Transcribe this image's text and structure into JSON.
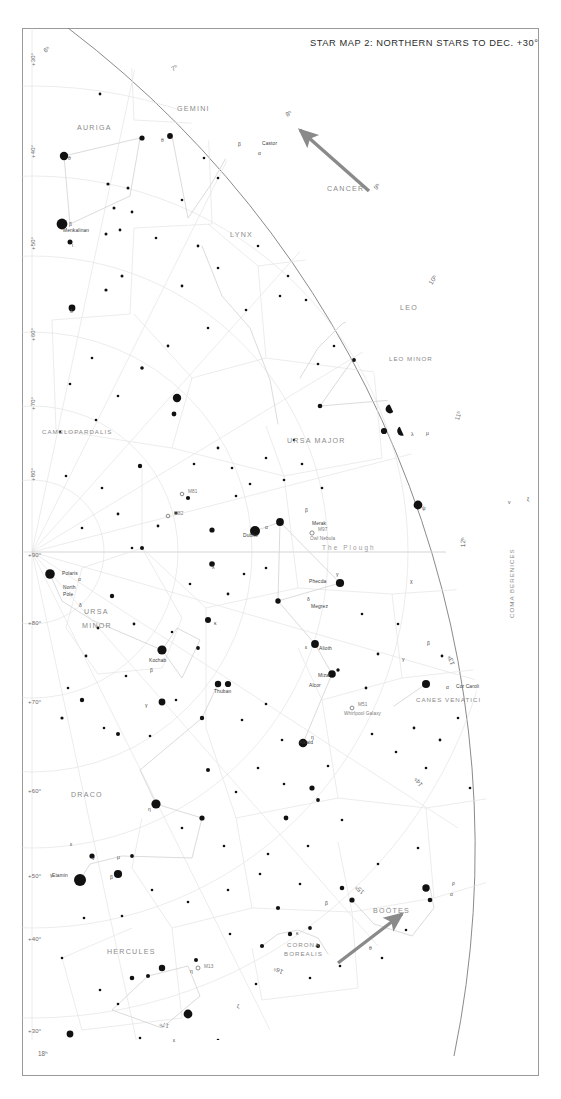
{
  "page": {
    "title": "STAR MAP 2: NORTHERN STARS TO DEC. +30°",
    "width": 561,
    "height": 1099,
    "background": "#ffffff",
    "frame_color": "#8e8e8e",
    "arrow_color": "#8a8a8a"
  },
  "chart_data": {
    "type": "scatter",
    "title": "STAR MAP 2: NORTHERN STARS TO DEC. +30°",
    "projection": "polar azimuthal, north pole centre-left",
    "xlabel": "Right Ascension (hours)",
    "ylabel": "Declination (degrees)",
    "grid": true,
    "legend_position": "none",
    "ra_range_hours": [
      6,
      18
    ],
    "dec_range_deg": [
      30,
      90
    ],
    "declination_labels": [
      "+30°",
      "+40°",
      "+50°",
      "+60°",
      "+70°",
      "+80°",
      "+90°"
    ],
    "right_ascension_labels": [
      "6ʰ",
      "7ʰ",
      "8ʰ",
      "9ʰ",
      "10ʰ",
      "11ʰ",
      "12ʰ",
      "13ʰ",
      "14ʰ",
      "15ʰ",
      "16ʰ",
      "17ʰ",
      "18ʰ"
    ],
    "constellations": [
      "AURIGA",
      "GEMINI",
      "CANCER",
      "LYNX",
      "LEO",
      "LEO MINOR",
      "CAMELOPARDALIS",
      "URSA MAJOR",
      "URSA MINOR",
      "DRACO",
      "CANES VENATICI",
      "COMA BERENICES",
      "BOÖTES",
      "CORONA BOREALIS",
      "HERCULES"
    ],
    "named_stars": [
      {
        "name": "Castor",
        "bayer": "α",
        "constellation": "GEMINI"
      },
      {
        "name": "Menkalinan",
        "bayer": "β",
        "constellation": "AURIGA"
      },
      {
        "name": "Polaris",
        "bayer": "α",
        "constellation": "URSA MINOR"
      },
      {
        "name": "Kochab",
        "bayer": "β",
        "constellation": "URSA MINOR"
      },
      {
        "name": "Dubhe",
        "bayer": "α",
        "constellation": "URSA MAJOR"
      },
      {
        "name": "Merak",
        "bayer": "β",
        "constellation": "URSA MAJOR"
      },
      {
        "name": "Phecda",
        "bayer": "γ",
        "constellation": "URSA MAJOR"
      },
      {
        "name": "Megrez",
        "bayer": "δ",
        "constellation": "URSA MAJOR"
      },
      {
        "name": "Alioth",
        "bayer": "ε",
        "constellation": "URSA MAJOR"
      },
      {
        "name": "Mizar",
        "bayer": "ζ",
        "constellation": "URSA MAJOR"
      },
      {
        "name": "Alcor",
        "bayer": "80",
        "constellation": "URSA MAJOR"
      },
      {
        "name": "Alkaid",
        "bayer": "η",
        "constellation": "URSA MAJOR"
      },
      {
        "name": "Thuban",
        "bayer": "α",
        "constellation": "DRACO"
      },
      {
        "name": "Etamin",
        "bayer": "γ",
        "constellation": "DRACO"
      },
      {
        "name": "Cor Caroli",
        "bayer": "α",
        "constellation": "CANES VENATICI"
      }
    ],
    "deep_sky_objects": [
      {
        "id": "M97",
        "name": "Owl Nebula"
      },
      {
        "id": "M51",
        "name": "Whirlpool Galaxy"
      },
      {
        "id": "M81",
        "name": ""
      },
      {
        "id": "M82",
        "name": ""
      },
      {
        "id": "M13",
        "name": ""
      }
    ],
    "annotations": [
      "The Plough",
      "North Pole"
    ]
  },
  "labels": {
    "north_pole": "North Pole",
    "plough": "The Plough",
    "owl_nebula": "Owl Nebula",
    "whirlpool": "Whirlpool Galaxy",
    "m97": "M97",
    "m51": "M51",
    "m81": "M81",
    "m82": "M82",
    "m13": "M13"
  },
  "dec_labels": [
    {
      "text": "+30°",
      "x": 8,
      "y": 38,
      "rot": -90
    },
    {
      "text": "+40°",
      "x": 8,
      "y": 130,
      "rot": -90
    },
    {
      "text": "+50°",
      "x": 8,
      "y": 222,
      "rot": -90
    },
    {
      "text": "+60°",
      "x": 8,
      "y": 313,
      "rot": -90
    },
    {
      "text": "+70°",
      "x": 8,
      "y": 382,
      "rot": -90
    },
    {
      "text": "+80°",
      "x": 8,
      "y": 453,
      "rot": -90
    },
    {
      "text": "+90°",
      "x": 6,
      "y": 524,
      "rot": 0
    },
    {
      "text": "+80°",
      "x": 6,
      "y": 592,
      "rot": 0
    },
    {
      "text": "+70°",
      "x": 6,
      "y": 671,
      "rot": 0
    },
    {
      "text": "+60°",
      "x": 6,
      "y": 760,
      "rot": 0
    },
    {
      "text": "+50°",
      "x": 6,
      "y": 845,
      "rot": 0
    },
    {
      "text": "+40°",
      "x": 6,
      "y": 908,
      "rot": 0
    },
    {
      "text": "+30°",
      "x": 6,
      "y": 1000,
      "rot": 0
    }
  ],
  "ra_labels": [
    {
      "text": "6ʰ",
      "x": 20,
      "y": 20,
      "rot": -34
    },
    {
      "text": "7ʰ",
      "x": 148,
      "y": 38,
      "rot": -28
    },
    {
      "text": "8ʰ",
      "x": 262,
      "y": 84,
      "rot": -32
    },
    {
      "text": "9ʰ",
      "x": 350,
      "y": 158,
      "rot": -44
    },
    {
      "text": "10ʰ",
      "x": 405,
      "y": 254,
      "rot": -58
    },
    {
      "text": "11ʰ",
      "x": 431,
      "y": 391,
      "rot": -72
    },
    {
      "text": "12ʰ",
      "x": 437,
      "y": 519,
      "rot": -88
    },
    {
      "text": "13ʰ",
      "x": 427,
      "y": 638,
      "rot": -108
    },
    {
      "text": "14ʰ",
      "x": 396,
      "y": 760,
      "rot": -124
    },
    {
      "text": "15ʰ",
      "x": 339,
      "y": 868,
      "rot": -140
    },
    {
      "text": "16ʰ",
      "x": 259,
      "y": 948,
      "rot": -154
    },
    {
      "text": "17ʰ",
      "x": 146,
      "y": 1002,
      "rot": -166
    },
    {
      "text": "18ʰ",
      "x": 16,
      "y": 1022,
      "rot": 0
    }
  ],
  "constellation_labels": [
    {
      "text": "AURIGA",
      "x": 55,
      "y": 96,
      "size": "md",
      "rot": 0
    },
    {
      "text": "GEMINI",
      "x": 155,
      "y": 77,
      "size": "md",
      "rot": 0
    },
    {
      "text": "CANCER",
      "x": 305,
      "y": 157,
      "size": "md",
      "rot": 0
    },
    {
      "text": "LYNX",
      "x": 208,
      "y": 203,
      "size": "md",
      "rot": 0
    },
    {
      "text": "LEO",
      "x": 378,
      "y": 276,
      "size": "md",
      "rot": 0
    },
    {
      "text": "LEO MINOR",
      "x": 367,
      "y": 327,
      "size": "sm",
      "rot": 0
    },
    {
      "text": "CAMELOPARDALIS",
      "x": 20,
      "y": 400,
      "size": "sm",
      "rot": 0
    },
    {
      "text": "URSA MAJOR",
      "x": 265,
      "y": 409,
      "size": "md",
      "rot": 0
    },
    {
      "text": "URSA",
      "x": 62,
      "y": 580,
      "size": "md",
      "rot": 0
    },
    {
      "text": "MINOR",
      "x": 60,
      "y": 594,
      "size": "md",
      "rot": 0
    },
    {
      "text": "DRACO",
      "x": 49,
      "y": 763,
      "size": "md",
      "rot": 0
    },
    {
      "text": "CANES VENATICI",
      "x": 394,
      "y": 668,
      "size": "sm",
      "rot": 0
    },
    {
      "text": "COMA BERENICES",
      "x": 486,
      "y": 590,
      "size": "sm",
      "rot": -90
    },
    {
      "text": "BOÖTES",
      "x": 351,
      "y": 879,
      "size": "md",
      "rot": 0
    },
    {
      "text": "CORONA",
      "x": 265,
      "y": 913,
      "size": "sm",
      "rot": 0
    },
    {
      "text": "BOREALIS",
      "x": 262,
      "y": 922,
      "size": "sm",
      "rot": 0
    },
    {
      "text": "HERCULES",
      "x": 85,
      "y": 920,
      "size": "md",
      "rot": 0
    }
  ],
  "star_name_labels": [
    {
      "text": "Castor",
      "x": 240,
      "y": 113
    },
    {
      "text": "Menkalinan",
      "x": 41,
      "y": 200
    },
    {
      "text": "Polaris",
      "x": 40,
      "y": 543
    },
    {
      "text": "North",
      "x": 41,
      "y": 557
    },
    {
      "text": "Pole",
      "x": 41,
      "y": 564
    },
    {
      "text": "Kochab",
      "x": 127,
      "y": 630
    },
    {
      "text": "Thuban",
      "x": 192,
      "y": 661
    },
    {
      "text": "Dubhe",
      "x": 221,
      "y": 505
    },
    {
      "text": "Merak",
      "x": 290,
      "y": 493
    },
    {
      "text": "Phecda",
      "x": 287,
      "y": 551
    },
    {
      "text": "Megrez",
      "x": 289,
      "y": 576
    },
    {
      "text": "Alioth",
      "x": 297,
      "y": 618
    },
    {
      "text": "Mizar",
      "x": 296,
      "y": 645
    },
    {
      "text": "Alcor",
      "x": 287,
      "y": 655
    },
    {
      "text": "Alkaid",
      "x": 277,
      "y": 712
    },
    {
      "text": "Cor Caroli",
      "x": 434,
      "y": 656
    },
    {
      "text": "Etamin",
      "x": 30,
      "y": 845
    }
  ],
  "dso_labels": [
    {
      "id": "M81",
      "x": 169,
      "y": 465
    },
    {
      "id": "M82",
      "x": 156,
      "y": 486
    },
    {
      "id": "M97",
      "x": 318,
      "y": 505
    },
    {
      "id": "Owl Nebula",
      "x": 308,
      "y": 513
    },
    {
      "id": "M51",
      "x": 352,
      "y": 680
    },
    {
      "id": "Whirlpool Galaxy",
      "x": 338,
      "y": 688
    },
    {
      "id": "M13",
      "x": 187,
      "y": 938
    }
  ],
  "greek_labels": [
    {
      "text": "α",
      "x": 236,
      "y": 122
    },
    {
      "text": "β",
      "x": 216,
      "y": 113
    },
    {
      "text": "θ",
      "x": 139,
      "y": 109
    },
    {
      "text": "θ",
      "x": 46,
      "y": 127
    },
    {
      "text": "β",
      "x": 47,
      "y": 193
    },
    {
      "text": "ι",
      "x": 50,
      "y": 214
    },
    {
      "text": "δ",
      "x": 48,
      "y": 280
    },
    {
      "text": "α",
      "x": 56,
      "y": 548
    },
    {
      "text": "δ",
      "x": 57,
      "y": 574
    },
    {
      "text": "β",
      "x": 128,
      "y": 639
    },
    {
      "text": "γ",
      "x": 123,
      "y": 674
    },
    {
      "text": "α",
      "x": 243,
      "y": 496
    },
    {
      "text": "β",
      "x": 283,
      "y": 479
    },
    {
      "text": "γ",
      "x": 314,
      "y": 543
    },
    {
      "text": "δ",
      "x": 285,
      "y": 568
    },
    {
      "text": "ε",
      "x": 283,
      "y": 616
    },
    {
      "text": "η",
      "x": 289,
      "y": 706
    },
    {
      "text": "ψ",
      "x": 400,
      "y": 477
    },
    {
      "text": "χ",
      "x": 388,
      "y": 550
    },
    {
      "text": "γ",
      "x": 380,
      "y": 628
    },
    {
      "text": "β",
      "x": 405,
      "y": 612
    },
    {
      "text": "α",
      "x": 424,
      "y": 656
    },
    {
      "text": "η",
      "x": 126,
      "y": 778
    },
    {
      "text": "γ",
      "x": 28,
      "y": 844
    },
    {
      "text": "β",
      "x": 88,
      "y": 846
    },
    {
      "text": "ν",
      "x": 70,
      "y": 827
    },
    {
      "text": "μ",
      "x": 95,
      "y": 826
    },
    {
      "text": "λ",
      "x": 190,
      "y": 536
    },
    {
      "text": "κ",
      "x": 192,
      "y": 592
    },
    {
      "text": "λ",
      "x": 389,
      "y": 403
    },
    {
      "text": "μ",
      "x": 404,
      "y": 402
    },
    {
      "text": "ν",
      "x": 486,
      "y": 471
    },
    {
      "text": "ξ",
      "x": 505,
      "y": 468
    },
    {
      "text": "β",
      "x": 303,
      "y": 872
    },
    {
      "text": "ρ",
      "x": 430,
      "y": 852
    },
    {
      "text": "σ",
      "x": 428,
      "y": 863
    },
    {
      "text": "θ",
      "x": 347,
      "y": 917
    },
    {
      "text": "κ",
      "x": 274,
      "y": 902
    },
    {
      "text": "ε",
      "x": 48,
      "y": 813
    },
    {
      "text": "η",
      "x": 168,
      "y": 940
    },
    {
      "text": "ζ",
      "x": 215,
      "y": 975
    },
    {
      "text": "ε",
      "x": 151,
      "y": 1009
    }
  ],
  "arrows": [
    {
      "name": "cancer-direction-arrow",
      "x1": 369,
      "y1": 191,
      "x2": 300,
      "y2": 130
    },
    {
      "name": "bootes-direction-arrow",
      "x1": 338,
      "y1": 963,
      "x2": 402,
      "y2": 914
    }
  ]
}
